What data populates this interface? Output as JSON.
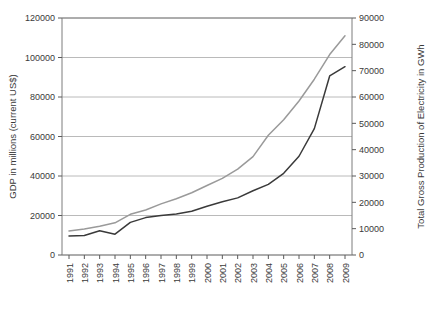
{
  "chart_data": {
    "type": "line",
    "title": "",
    "xlabel": "",
    "grid": true,
    "legend": "none",
    "categories": [
      "1991",
      "1992",
      "1993",
      "1994",
      "1995",
      "1996",
      "1997",
      "1998",
      "1999",
      "2000",
      "2001",
      "2002",
      "2003",
      "2004",
      "2005",
      "2006",
      "2007",
      "2008",
      "2009"
    ],
    "left_axis": {
      "label": "GDP in millions (current US$)",
      "ticks": [
        "0",
        "20000",
        "40000",
        "60000",
        "80000",
        "100000",
        "120000"
      ],
      "lim": [
        0,
        120000
      ],
      "step": 20000
    },
    "right_axis": {
      "label": "Total Gross Production of Electricity in GWh",
      "ticks": [
        "0",
        "10000",
        "20000",
        "30000",
        "40000",
        "50000",
        "60000",
        "70000",
        "80000",
        "90000"
      ],
      "lim": [
        0,
        90000
      ],
      "step": 10000
    },
    "series": [
      {
        "name": "GDP in millions (current US$)",
        "axis": "left",
        "color": "#9a9a9a",
        "values": [
          12200,
          13200,
          14600,
          16300,
          20600,
          22800,
          25900,
          28500,
          31500,
          35200,
          38800,
          43500,
          49800,
          60600,
          68500,
          78000,
          89000,
          101500,
          111000
        ]
      },
      {
        "name": "Total Gross Production of Electricity in GWh",
        "axis": "right",
        "color": "#3a3a3a",
        "values": [
          7200,
          7400,
          9200,
          7900,
          12400,
          14200,
          15000,
          15600,
          16600,
          18500,
          20200,
          21700,
          24400,
          26800,
          31000,
          37500,
          48000,
          68000,
          71500
        ]
      }
    ]
  },
  "geometry": {
    "plot_left": 62,
    "plot_right": 352,
    "plot_top": 18,
    "plot_bottom": 255
  }
}
